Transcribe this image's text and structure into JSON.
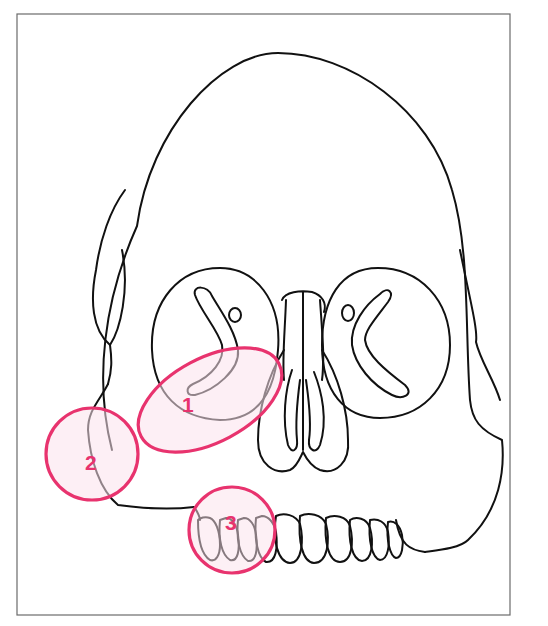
{
  "figure": {
    "colors": {
      "line": "#111111",
      "frame": "#6b6b6b",
      "zone_stroke": "#e8336e",
      "zone_fill": "#fbe1ec",
      "label": "#e8336e"
    }
  },
  "zones": [
    {
      "id": 1,
      "label": "1",
      "shape": "ellipse",
      "description": "zygoma / cheekbone body below right orbit"
    },
    {
      "id": 2,
      "label": "2",
      "shape": "circle",
      "description": "zygomatic arch / lateral mid-face"
    },
    {
      "id": 3,
      "label": "3",
      "shape": "circle",
      "description": "upper lateral teeth / maxillary dentition"
    }
  ]
}
